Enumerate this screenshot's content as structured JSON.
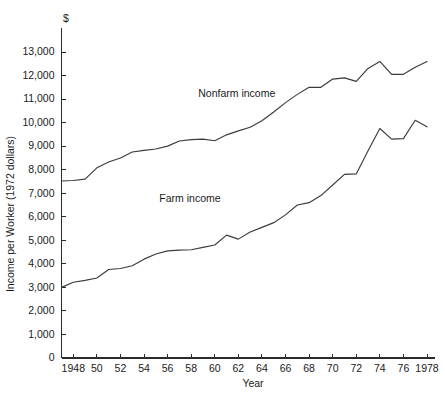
{
  "chart_data": {
    "type": "line",
    "title": "",
    "subtitle": "",
    "xlabel": "Year",
    "ylabel": "Income per Worker (1972 dollars)",
    "unit_marker": "$",
    "xlim": [
      1947,
      1978
    ],
    "ylim": [
      0,
      13600
    ],
    "grid": false,
    "legend_position": "inline-annotation",
    "y_ticks": [
      0,
      1000,
      2000,
      3000,
      4000,
      5000,
      6000,
      7000,
      8000,
      9000,
      10000,
      11000,
      12000,
      13000
    ],
    "y_tick_labels": [
      "0",
      "1,000",
      "2,000",
      "3,000",
      "4,000",
      "5,000",
      "6,000",
      "7,000",
      "8,000",
      "9,000",
      "10,000",
      "11,000",
      "12,000",
      "13,000"
    ],
    "x_ticks": [
      1948,
      1950,
      1952,
      1954,
      1956,
      1958,
      1960,
      1962,
      1964,
      1966,
      1968,
      1970,
      1972,
      1974,
      1976,
      1978
    ],
    "x_tick_labels": [
      "1948",
      "50",
      "52",
      "54",
      "56",
      "58",
      "60",
      "62",
      "64",
      "66",
      "68",
      "70",
      "72",
      "74",
      "76",
      "1978"
    ],
    "x": [
      1947,
      1948,
      1949,
      1950,
      1951,
      1952,
      1953,
      1954,
      1955,
      1956,
      1957,
      1958,
      1959,
      1960,
      1961,
      1962,
      1963,
      1964,
      1965,
      1966,
      1967,
      1968,
      1969,
      1970,
      1971,
      1972,
      1973,
      1974,
      1975,
      1976,
      1977,
      1978
    ],
    "series": [
      {
        "name": "Nonfarm income",
        "label": "Nonfarm income",
        "color": "#3b3b3b",
        "label_x": 1958.6,
        "label_y": 11100,
        "values": [
          7520,
          7540,
          7600,
          8080,
          8330,
          8500,
          8750,
          8820,
          8880,
          9000,
          9220,
          9280,
          9300,
          9230,
          9480,
          9650,
          9800,
          10080,
          10450,
          10850,
          11200,
          11500,
          11500,
          11850,
          11900,
          11750,
          12300,
          12600,
          12050,
          12050,
          12350,
          12600
        ]
      },
      {
        "name": "Farm income",
        "label": "Farm income",
        "color": "#3b3b3b",
        "label_x": 1955.3,
        "label_y": 6620,
        "values": [
          3000,
          3220,
          3300,
          3400,
          3760,
          3800,
          3920,
          4200,
          4420,
          4550,
          4580,
          4600,
          4700,
          4800,
          5220,
          5050,
          5350,
          5550,
          5750,
          6080,
          6500,
          6600,
          6900,
          7350,
          7800,
          7820,
          8800,
          9750,
          9300,
          9320,
          10100,
          9820
        ]
      }
    ]
  },
  "axes": {
    "y_axis_title": "Income per Worker (1972 dollars)",
    "x_axis_title": "Year",
    "currency_symbol": "$"
  }
}
